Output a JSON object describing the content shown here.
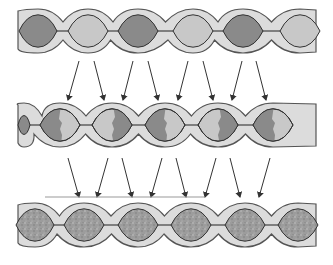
{
  "diagram": {
    "colors": {
      "tube_fill": "#dcdcdc",
      "tube_stroke": "#555555",
      "cell_light": "#c8c8c8",
      "cell_dark": "#8a8a8a",
      "cell_textured": "#9a9a9a",
      "arrow": "#333333",
      "baseline": "#999999"
    },
    "rows": [
      {
        "id": "stage-1",
        "center_y": 31,
        "cells": [
          {
            "cx": 38,
            "tone": "dark"
          },
          {
            "cx": 88,
            "tone": "light"
          },
          {
            "cx": 138,
            "tone": "dark"
          },
          {
            "cx": 193,
            "tone": "light"
          },
          {
            "cx": 243,
            "tone": "dark"
          },
          {
            "cx": 300,
            "tone": "light"
          }
        ]
      },
      {
        "id": "stage-2",
        "center_y": 125,
        "cells": [
          {
            "cx": 24,
            "tone": "dark-small"
          },
          {
            "cx": 60,
            "tone": "half",
            "dark_side": "left"
          },
          {
            "cx": 112,
            "tone": "half",
            "dark_side": "right"
          },
          {
            "cx": 165,
            "tone": "half",
            "dark_side": "left"
          },
          {
            "cx": 218,
            "tone": "half",
            "dark_side": "right"
          },
          {
            "cx": 273,
            "tone": "half",
            "dark_side": "left"
          }
        ]
      },
      {
        "id": "stage-3",
        "center_y": 225,
        "cells": [
          {
            "cx": 35,
            "tone": "textured"
          },
          {
            "cx": 84,
            "tone": "textured"
          },
          {
            "cx": 138,
            "tone": "textured"
          },
          {
            "cx": 191,
            "tone": "textured"
          },
          {
            "cx": 245,
            "tone": "textured"
          },
          {
            "cx": 298,
            "tone": "textured"
          }
        ]
      }
    ],
    "arrows_upper": [
      {
        "x1": 79,
        "y1": 61,
        "x2": 68,
        "y2": 100
      },
      {
        "x1": 94,
        "y1": 61,
        "x2": 104,
        "y2": 100
      },
      {
        "x1": 133,
        "y1": 61,
        "x2": 123,
        "y2": 100
      },
      {
        "x1": 148,
        "y1": 61,
        "x2": 158,
        "y2": 100
      },
      {
        "x1": 188,
        "y1": 61,
        "x2": 178,
        "y2": 100
      },
      {
        "x1": 203,
        "y1": 61,
        "x2": 213,
        "y2": 100
      },
      {
        "x1": 242,
        "y1": 61,
        "x2": 232,
        "y2": 100
      },
      {
        "x1": 256,
        "y1": 61,
        "x2": 266,
        "y2": 100
      }
    ],
    "arrows_lower": [
      {
        "x1": 68,
        "y1": 158,
        "x2": 79,
        "y2": 197
      },
      {
        "x1": 108,
        "y1": 158,
        "x2": 97,
        "y2": 197
      },
      {
        "x1": 122,
        "y1": 158,
        "x2": 132,
        "y2": 197
      },
      {
        "x1": 162,
        "y1": 158,
        "x2": 151,
        "y2": 197
      },
      {
        "x1": 176,
        "y1": 158,
        "x2": 186,
        "y2": 197
      },
      {
        "x1": 216,
        "y1": 158,
        "x2": 205,
        "y2": 197
      },
      {
        "x1": 230,
        "y1": 158,
        "x2": 240,
        "y2": 197
      },
      {
        "x1": 270,
        "y1": 158,
        "x2": 259,
        "y2": 197
      }
    ],
    "baseline": {
      "x1": 45,
      "x2": 205,
      "y": 197
    }
  }
}
